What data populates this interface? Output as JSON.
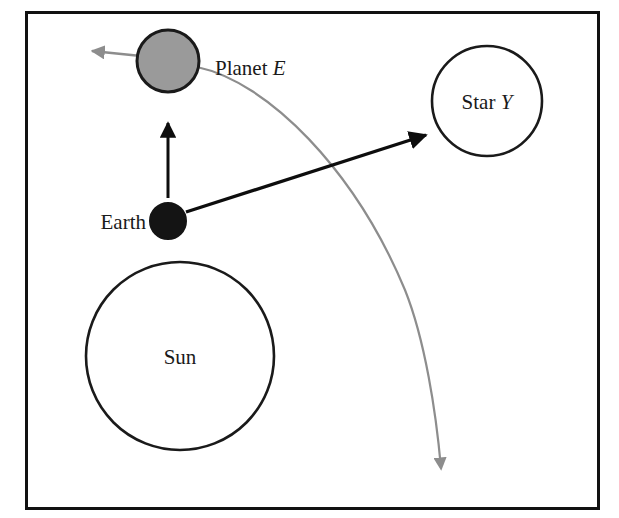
{
  "figure": {
    "type": "astronomy-schematic",
    "border_color": "#111111",
    "background_color": "#ffffff",
    "frame": {
      "x": 25,
      "y": 11,
      "width": 575,
      "height": 499
    }
  },
  "bodies": [
    {
      "key": "planet_e",
      "label_text": "Planet ",
      "label_italic": "E",
      "shape": "circle",
      "fill": "#9a9a9a",
      "stroke": "#1a1a1a",
      "cx": 168,
      "cy": 61,
      "r": 31,
      "label_x": 215,
      "label_y": 75,
      "label_anchor": "start",
      "label_inside": false
    },
    {
      "key": "star_y",
      "label_text": "Star ",
      "label_italic": "Y",
      "shape": "circle",
      "fill": "#ffffff",
      "stroke": "#1a1a1a",
      "cx": 487,
      "cy": 101,
      "r": 55,
      "label_x": 487,
      "label_y": 109,
      "label_anchor": "middle",
      "label_inside": true
    },
    {
      "key": "earth",
      "label_text": "Earth",
      "label_italic": "",
      "shape": "circle",
      "fill": "#141414",
      "stroke": "#141414",
      "cx": 168,
      "cy": 221,
      "r": 18,
      "label_x": 146,
      "label_y": 229,
      "label_anchor": "end",
      "label_inside": false
    },
    {
      "key": "sun",
      "label_text": "Sun",
      "label_italic": "",
      "shape": "circle",
      "fill": "#ffffff",
      "stroke": "#1a1a1a",
      "cx": 180,
      "cy": 356,
      "r": 94,
      "label_x": 180,
      "label_y": 364,
      "label_anchor": "middle",
      "label_inside": true
    }
  ],
  "arrows": [
    {
      "key": "earth-to-planet",
      "color": "#0d0d0d",
      "width": 3,
      "from_x": 168,
      "from_y": 198,
      "to_x": 168,
      "to_y": 117,
      "head": "solid-triangle"
    },
    {
      "key": "earth-to-star",
      "color": "#0d0d0d",
      "width": 3.5,
      "from_x": 186,
      "from_y": 212,
      "to_x": 430,
      "to_y": 133,
      "head": "solid-triangle"
    },
    {
      "key": "planet-velocity",
      "color": "#8d8d8d",
      "width": 2.5,
      "from_x": 137,
      "from_y": 56,
      "to_x": 86,
      "to_y": 51,
      "head": "solid-triangle"
    }
  ],
  "curves": [
    {
      "key": "planet-trajectory",
      "color": "#8d8d8d",
      "width": 2.2,
      "path": "M 197 67 C 268 82, 355 170, 405 290 C 425 340, 436 410, 441 462",
      "head": "solid-triangle",
      "head_x": 441,
      "head_y": 478,
      "head_angle": 97
    }
  ]
}
